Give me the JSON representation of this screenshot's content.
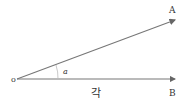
{
  "diagram": {
    "title": "각",
    "origin_label": "o",
    "point_a_label": "A",
    "point_b_label": "B",
    "angle_label": "a",
    "caption": "각",
    "colors": {
      "ray": "#666666",
      "text": "#333333",
      "arc": "#aaaaaa"
    },
    "points": {
      "origin": [
        15,
        79
      ],
      "a_end": [
        176,
        20
      ],
      "b_end": [
        176,
        79
      ]
    }
  }
}
